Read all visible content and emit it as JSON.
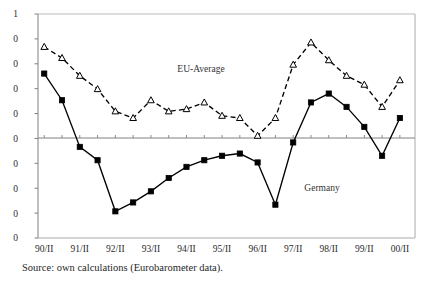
{
  "figure": {
    "caption": "Source: own calculations (Eurobarometer data)."
  },
  "annotations": {
    "eu_label": "EU-Average",
    "germany_label": "Germany"
  },
  "colors": {
    "line": "#000000",
    "axis": "#808080",
    "frame": "#aaaaaa",
    "text": "#1f1f1f"
  },
  "chart_data": {
    "type": "line",
    "title": "",
    "xlabel": "",
    "ylabel": "",
    "grid": false,
    "legend_position": "inline-annotation",
    "zero_line": true,
    "x_tick_labels": [
      "90/II",
      "91/II",
      "92/II",
      "93/II",
      "94/II",
      "95/II",
      "96/II",
      "97/II",
      "98/II",
      "99/II",
      "00/II"
    ],
    "y_tick_labels": [
      "1",
      "0",
      "0",
      "0",
      "0",
      "0",
      "0",
      "0",
      "0",
      "0"
    ],
    "y_tick_note": "y-axis tick labels are clipped at the left edge of the screenshot; only the final character of each label is visible",
    "ylim": [
      -45,
      60
    ],
    "xlim": [
      0,
      21
    ],
    "x": [
      "90/II",
      "91/I",
      "91/II",
      "92/I",
      "92/II",
      "93/I",
      "93/II",
      "94/I",
      "94/II",
      "95/I",
      "95/II",
      "96/I",
      "96/II",
      "97/I",
      "97/II",
      "98/I",
      "98/II",
      "99/I",
      "99/II",
      "00/I",
      "00/II"
    ],
    "series": [
      {
        "name": "EU-Average",
        "marker": "triangle-open",
        "linestyle": "dashed",
        "values": [
          41,
          36,
          28,
          22,
          12,
          9,
          17,
          12,
          13,
          16,
          10,
          9,
          1,
          9,
          33,
          43,
          35,
          28,
          24,
          14,
          26
        ]
      },
      {
        "name": "Germany",
        "marker": "square-filled",
        "linestyle": "solid",
        "values": [
          29,
          17,
          -4,
          -10,
          -33,
          -29,
          -24,
          -18,
          -13,
          -10,
          -8,
          -7,
          -11,
          -30,
          -2,
          16,
          20,
          14,
          5,
          -8,
          9
        ]
      }
    ]
  }
}
